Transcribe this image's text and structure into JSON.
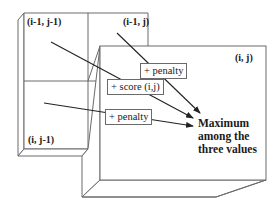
{
  "cells": {
    "top_left": "(i-1, j-1)",
    "top_right": "(i-1, j)",
    "bottom_left": "(i, j-1)",
    "current": "(i, j)"
  },
  "operations": {
    "diagonal": "+ score (i,j)",
    "from_top": "+ penalty",
    "from_left": "+ penalty"
  },
  "result": {
    "line1": "Maximum",
    "line2": "among the",
    "line3": "three values"
  }
}
